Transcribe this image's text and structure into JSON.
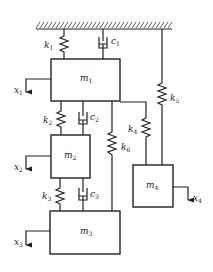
{
  "diagram": {
    "type": "mass-spring-damper system",
    "ground": {
      "label": "fixed support (hatched)"
    },
    "masses": [
      {
        "id": "m1",
        "symbol": "m",
        "sub": "1"
      },
      {
        "id": "m2",
        "symbol": "m",
        "sub": "2"
      },
      {
        "id": "m3",
        "symbol": "m",
        "sub": "3"
      },
      {
        "id": "m4",
        "symbol": "m",
        "sub": "4"
      }
    ],
    "springs": [
      {
        "id": "k1",
        "symbol": "k",
        "sub": "1",
        "connects": "ground-m1"
      },
      {
        "id": "k2",
        "symbol": "k",
        "sub": "2",
        "connects": "m1-m2"
      },
      {
        "id": "k3",
        "symbol": "k",
        "sub": "3",
        "connects": "m2-m3"
      },
      {
        "id": "k4",
        "symbol": "k",
        "sub": "4",
        "connects": "m1-m4"
      },
      {
        "id": "k5",
        "symbol": "k",
        "sub": "5",
        "connects": "ground-m4"
      },
      {
        "id": "k6",
        "symbol": "k",
        "sub": "6",
        "connects": "m1-m3"
      }
    ],
    "dampers": [
      {
        "id": "c1",
        "symbol": "c",
        "sub": "1",
        "connects": "ground-m1"
      },
      {
        "id": "c2",
        "symbol": "c",
        "sub": "2",
        "connects": "m1-m2"
      },
      {
        "id": "c3",
        "symbol": "c",
        "sub": "3",
        "connects": "m2-m3"
      }
    ],
    "displacements": [
      {
        "id": "x1",
        "symbol": "x",
        "sub": "1"
      },
      {
        "id": "x2",
        "symbol": "x",
        "sub": "2"
      },
      {
        "id": "x3",
        "symbol": "x",
        "sub": "3"
      },
      {
        "id": "x4",
        "symbol": "x",
        "sub": "4"
      }
    ]
  }
}
